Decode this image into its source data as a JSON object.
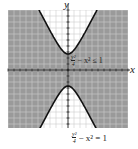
{
  "chart_data": {
    "type": "line",
    "title": "",
    "xlabel": "x",
    "ylabel": "y",
    "xlim": [
      -7.5,
      7.5
    ],
    "ylim": [
      -7.5,
      7.5
    ],
    "grid": true,
    "series": [
      {
        "name": "y^2/4 - x^2 = 1",
        "equation": "y^2/4 - x^2 = 1",
        "style": "solid boundary"
      }
    ],
    "shaded_region": "y^2/4 - x^2 <= 1",
    "annotations": [
      "y²/4 − x² ≤ 1",
      "y²/4 − x² = 1"
    ],
    "vertices": [
      [
        0,
        2
      ],
      [
        0,
        -2
      ]
    ]
  },
  "labels": {
    "x_axis": "x",
    "y_axis": "y",
    "inequality": {
      "num": "y²",
      "den": "4",
      "rest": "− x² ≤ 1"
    },
    "equation": {
      "num": "y²",
      "den": "4",
      "rest": "− x² = 1"
    }
  },
  "colors": {
    "shade": "#9a9a9a",
    "curve": "#111111",
    "grid": "#bdbdbd"
  }
}
